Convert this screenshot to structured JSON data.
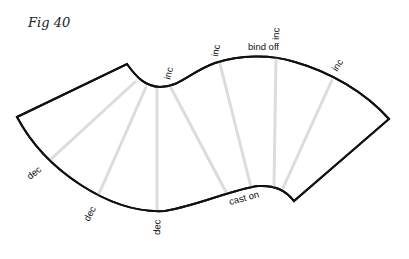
{
  "figure": {
    "title": "Fig 40",
    "outline_color": "#111111",
    "guide_color": "#dcdcdc",
    "labels": {
      "inc_1": "inc",
      "inc_2": "inc",
      "inc_3": "inc",
      "inc_4": "inc",
      "bind_off": "bind off",
      "cast_on": "cast on",
      "dec_1": "dec",
      "dec_2": "dec",
      "dec_3": "dec"
    }
  }
}
